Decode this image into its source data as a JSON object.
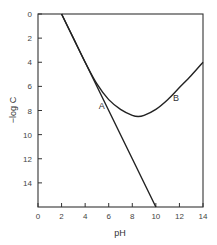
{
  "chart_data": {
    "type": "line",
    "title": "",
    "xlabel": "pH",
    "ylabel": "−log C",
    "xlim": [
      0,
      14
    ],
    "ylim": [
      16,
      0
    ],
    "y_inverted": true,
    "xticks": [
      0,
      2,
      4,
      6,
      8,
      10,
      12,
      14
    ],
    "yticks": [
      0,
      2,
      4,
      6,
      8,
      10,
      12,
      14
    ],
    "grid": false,
    "legend": null,
    "series": [
      {
        "name": "A",
        "style": "straight line",
        "x": [
          2,
          4,
          6,
          8,
          10
        ],
        "y": [
          0,
          4,
          8,
          12,
          16
        ]
      },
      {
        "name": "B",
        "style": "curve",
        "x": [
          2,
          3,
          4,
          5,
          6,
          7,
          8,
          8.5,
          9,
          10,
          11,
          12,
          13,
          14
        ],
        "y": [
          0,
          2,
          4,
          5.8,
          7.1,
          7.9,
          8.4,
          8.5,
          8.4,
          7.9,
          7.1,
          6.1,
          5.1,
          4.0
        ]
      }
    ],
    "annotations": [
      {
        "text": "A",
        "x": 5.4,
        "y": 7.9
      },
      {
        "text": "B",
        "x": 11.7,
        "y": 7.2
      }
    ],
    "colors": {
      "line": "#222222",
      "frame": "#333333",
      "background": "#ffffff"
    }
  }
}
